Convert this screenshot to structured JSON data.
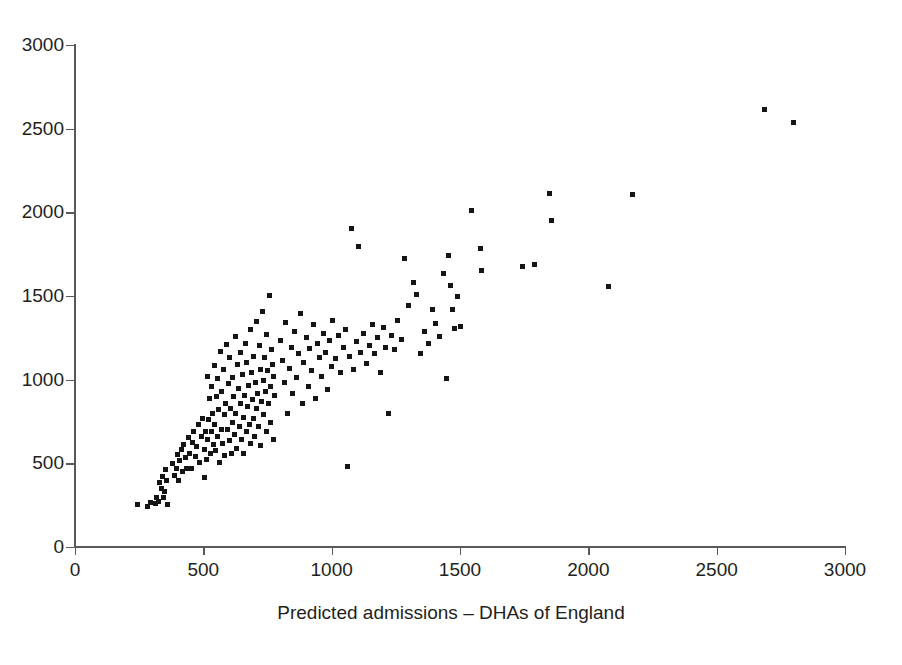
{
  "figure": {
    "background_color": "#ffffff",
    "marker_color": "#151515",
    "axis_color": "#58595b",
    "text_color": "#231f20"
  },
  "axes": {
    "x_title": "Predicted admissions – DHAs of England",
    "y_title_partial": "Actual no. of admissions",
    "y_title_note": "clipped at left edge of image",
    "x_ticks": [
      "0",
      "500",
      "1000",
      "1500",
      "2000",
      "2500",
      "3000"
    ],
    "y_ticks": [
      "0",
      "500",
      "1000",
      "1500",
      "2000",
      "2500",
      "3000"
    ]
  },
  "chart_data": {
    "type": "scatter",
    "title": "",
    "xlabel": "Predicted admissions – DHAs of England",
    "ylabel": "Actual no. of admissions",
    "xlim": [
      0,
      3000
    ],
    "ylim": [
      0,
      3000
    ],
    "xticks": [
      0,
      500,
      1000,
      1500,
      2000,
      2500,
      3000
    ],
    "yticks": [
      0,
      500,
      1000,
      1500,
      2000,
      2500,
      3000
    ],
    "grid": false,
    "legend": false,
    "marker": "square",
    "marker_size_px": 5,
    "n_points": 196,
    "series": [
      {
        "name": "District Health Authorities",
        "points": [
          [
            242,
            254
          ],
          [
            283,
            243
          ],
          [
            294,
            263
          ],
          [
            312,
            259
          ],
          [
            318,
            296
          ],
          [
            324,
            271
          ],
          [
            330,
            388
          ],
          [
            336,
            352
          ],
          [
            341,
            420
          ],
          [
            345,
            293
          ],
          [
            349,
            330
          ],
          [
            352,
            466
          ],
          [
            358,
            398
          ],
          [
            360,
            255
          ],
          [
            381,
            500
          ],
          [
            389,
            430
          ],
          [
            394,
            470
          ],
          [
            399,
            555
          ],
          [
            404,
            398
          ],
          [
            409,
            514
          ],
          [
            414,
            585
          ],
          [
            419,
            449
          ],
          [
            424,
            610
          ],
          [
            430,
            533
          ],
          [
            435,
            470
          ],
          [
            441,
            655
          ],
          [
            446,
            560
          ],
          [
            452,
            472
          ],
          [
            458,
            625
          ],
          [
            463,
            690
          ],
          [
            468,
            540
          ],
          [
            474,
            600
          ],
          [
            480,
            730
          ],
          [
            486,
            505
          ],
          [
            492,
            660
          ],
          [
            497,
            770
          ],
          [
            503,
            583
          ],
          [
            505,
            413
          ],
          [
            509,
            690
          ],
          [
            512,
            525
          ],
          [
            515,
            1020
          ],
          [
            518,
            640
          ],
          [
            521,
            760
          ],
          [
            524,
            885
          ],
          [
            527,
            560
          ],
          [
            530,
            960
          ],
          [
            533,
            690
          ],
          [
            536,
            800
          ],
          [
            539,
            610
          ],
          [
            542,
            1085
          ],
          [
            545,
            730
          ],
          [
            548,
            575
          ],
          [
            551,
            900
          ],
          [
            554,
            1005
          ],
          [
            557,
            660
          ],
          [
            560,
            820
          ],
          [
            563,
            505
          ],
          [
            566,
            1170
          ],
          [
            569,
            700
          ],
          [
            572,
            930
          ],
          [
            575,
            620
          ],
          [
            578,
            1060
          ],
          [
            581,
            790
          ],
          [
            584,
            545
          ],
          [
            588,
            860
          ],
          [
            591,
            1210
          ],
          [
            594,
            705
          ],
          [
            597,
            980
          ],
          [
            600,
            635
          ],
          [
            603,
            1130
          ],
          [
            606,
            830
          ],
          [
            609,
            560
          ],
          [
            612,
            745
          ],
          [
            615,
            1010
          ],
          [
            618,
            900
          ],
          [
            621,
            670
          ],
          [
            624,
            1255
          ],
          [
            627,
            800
          ],
          [
            630,
            590
          ],
          [
            634,
            1090
          ],
          [
            637,
            950
          ],
          [
            640,
            720
          ],
          [
            643,
            860
          ],
          [
            646,
            1160
          ],
          [
            649,
            645
          ],
          [
            652,
            1030
          ],
          [
            655,
            775
          ],
          [
            658,
            560
          ],
          [
            661,
            905
          ],
          [
            664,
            1215
          ],
          [
            667,
            690
          ],
          [
            670,
            1105
          ],
          [
            673,
            840
          ],
          [
            676,
            965
          ],
          [
            679,
            730
          ],
          [
            682,
            1300
          ],
          [
            685,
            620
          ],
          [
            688,
            1045
          ],
          [
            691,
            880
          ],
          [
            694,
            770
          ],
          [
            697,
            1140
          ],
          [
            700,
            660
          ],
          [
            703,
            985
          ],
          [
            706,
            1345
          ],
          [
            709,
            830
          ],
          [
            712,
            915
          ],
          [
            715,
            720
          ],
          [
            718,
            1205
          ],
          [
            721,
            1060
          ],
          [
            724,
            605
          ],
          [
            727,
            870
          ],
          [
            730,
            1410
          ],
          [
            733,
            995
          ],
          [
            736,
            790
          ],
          [
            739,
            1130
          ],
          [
            742,
            930
          ],
          [
            745,
            690
          ],
          [
            748,
            1270
          ],
          [
            751,
            1055
          ],
          [
            754,
            860
          ],
          [
            757,
            1505
          ],
          [
            760,
            960
          ],
          [
            763,
            745
          ],
          [
            766,
            1180
          ],
          [
            769,
            1090
          ],
          [
            772,
            640
          ],
          [
            775,
            1020
          ],
          [
            778,
            905
          ],
          [
            800,
            1235
          ],
          [
            808,
            1115
          ],
          [
            815,
            985
          ],
          [
            822,
            1340
          ],
          [
            828,
            800
          ],
          [
            835,
            1065
          ],
          [
            842,
            1195
          ],
          [
            848,
            915
          ],
          [
            855,
            1290
          ],
          [
            862,
            1010
          ],
          [
            870,
            1155
          ],
          [
            878,
            1395
          ],
          [
            885,
            860
          ],
          [
            892,
            1100
          ],
          [
            900,
            1250
          ],
          [
            908,
            960
          ],
          [
            915,
            1185
          ],
          [
            922,
            1055
          ],
          [
            930,
            1330
          ],
          [
            938,
            890
          ],
          [
            945,
            1215
          ],
          [
            952,
            1130
          ],
          [
            960,
            1020
          ],
          [
            968,
            1275
          ],
          [
            975,
            1160
          ],
          [
            982,
            940
          ],
          [
            990,
            1235
          ],
          [
            998,
            1080
          ],
          [
            1005,
            1355
          ],
          [
            1015,
            1125
          ],
          [
            1025,
            1265
          ],
          [
            1035,
            1040
          ],
          [
            1045,
            1190
          ],
          [
            1055,
            1300
          ],
          [
            1060,
            484
          ],
          [
            1068,
            1140
          ],
          [
            1078,
            1905
          ],
          [
            1085,
            1060
          ],
          [
            1095,
            1230
          ],
          [
            1105,
            1795
          ],
          [
            1112,
            1165
          ],
          [
            1125,
            1275
          ],
          [
            1135,
            1095
          ],
          [
            1148,
            1205
          ],
          [
            1158,
            1330
          ],
          [
            1168,
            1155
          ],
          [
            1180,
            1250
          ],
          [
            1190,
            1045
          ],
          [
            1200,
            1310
          ],
          [
            1210,
            1195
          ],
          [
            1220,
            800
          ],
          [
            1232,
            1265
          ],
          [
            1245,
            1180
          ],
          [
            1258,
            1355
          ],
          [
            1272,
            1240
          ],
          [
            1285,
            1725
          ],
          [
            1300,
            1445
          ],
          [
            1318,
            1580
          ],
          [
            1330,
            1510
          ],
          [
            1345,
            1155
          ],
          [
            1362,
            1290
          ],
          [
            1378,
            1215
          ],
          [
            1392,
            1420
          ],
          [
            1405,
            1335
          ],
          [
            1420,
            1260
          ],
          [
            1435,
            1635
          ],
          [
            1448,
            1005
          ],
          [
            1455,
            1740
          ],
          [
            1462,
            1560
          ],
          [
            1470,
            1420
          ],
          [
            1478,
            1305
          ],
          [
            1490,
            1500
          ],
          [
            1500,
            1320
          ],
          [
            1545,
            2010
          ],
          [
            1578,
            1785
          ],
          [
            1585,
            1650
          ],
          [
            1745,
            1675
          ],
          [
            1792,
            1690
          ],
          [
            1848,
            2110
          ],
          [
            1855,
            1950
          ],
          [
            2080,
            1555
          ],
          [
            2172,
            2105
          ],
          [
            2688,
            2615
          ],
          [
            2798,
            2535
          ]
        ]
      }
    ]
  }
}
